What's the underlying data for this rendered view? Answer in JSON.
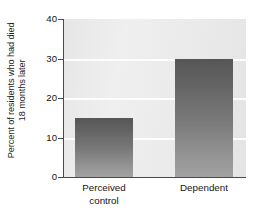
{
  "chart_data": {
    "type": "bar",
    "title": "",
    "xlabel": "",
    "ylabel": "Percent of residents who had died 18 months later",
    "ylabel_lines": [
      "Percent of residents who had died",
      "18 months later"
    ],
    "categories": [
      "Perceived control",
      "Dependent"
    ],
    "category_lines": [
      [
        "Perceived",
        "control"
      ],
      [
        "Dependent"
      ]
    ],
    "values": [
      15,
      30
    ],
    "ylim": [
      0,
      40
    ],
    "yticks": [
      0,
      10,
      20,
      30,
      40
    ],
    "ytick_labels": [
      "0",
      "10",
      "20",
      "30",
      "40"
    ],
    "grid": true,
    "grid_axis": "y",
    "legend": false,
    "bar_color": "#6e6e6e",
    "plot_background": "#e9e9e9",
    "gridline_color": "#fdfdfd",
    "axis_color": "#4a4a4a",
    "page_background": "#ffffff"
  }
}
